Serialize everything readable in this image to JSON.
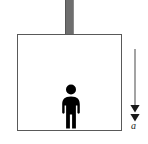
{
  "figure": {
    "background_color": "#ffffff"
  },
  "cable": {
    "name": "suspension cable",
    "color": "#6e6e6e"
  },
  "elevator": {
    "name": "elevator car",
    "border_color": "#595959",
    "fill_color": "#ffffff"
  },
  "person": {
    "name": "person standing inside elevator",
    "color": "#000000"
  },
  "acceleration": {
    "name": "acceleration vector",
    "label": "a",
    "direction": "down",
    "arrowheads": 2,
    "color": "#1a1a1a",
    "shaft_color": "#8c8c8c"
  }
}
